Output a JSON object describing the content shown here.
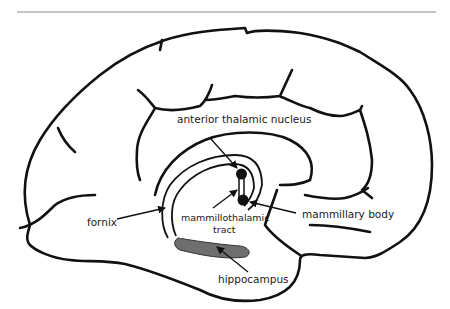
{
  "figure": {
    "type": "brain-midsagittal-diagram",
    "labels": {
      "anterior_thalamic_nucleus": "anterior thalamic nucleus",
      "mammillary_body": "mammillary body",
      "fornix": "fornix",
      "mammillothalamic_tract_line1": "mammillothalamic",
      "mammillothalamic_tract_line2": "tract",
      "hippocampus": "hippocampus"
    },
    "colors": {
      "outline": "#111111",
      "hippocampus_fill": "#6e6e6e",
      "rule": "#8a8a8a",
      "background": "#ffffff"
    }
  }
}
